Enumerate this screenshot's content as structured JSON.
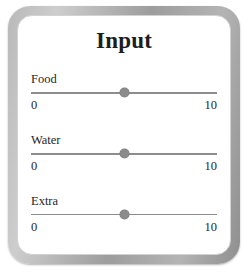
{
  "panel": {
    "title": "Input",
    "frame_color": "#a8a8a8",
    "background_color": "#ffffff"
  },
  "sliders": [
    {
      "label": "Food",
      "min_label": "0",
      "max_label": "10",
      "min": 0,
      "max": 10,
      "value": 5,
      "handle_percent": 50,
      "track_color": "#8d8d8d",
      "handle_color": "#8b8b8b"
    },
    {
      "label": "Water",
      "min_label": "0",
      "max_label": "10",
      "min": 0,
      "max": 10,
      "value": 5,
      "handle_percent": 50,
      "track_color": "#8d8d8d",
      "handle_color": "#8b8b8b"
    },
    {
      "label": "Extra",
      "min_label": "0",
      "max_label": "10",
      "min": 0,
      "max": 10,
      "value": 5,
      "handle_percent": 50,
      "track_color": "#8d8d8d",
      "handle_color": "#8b8b8b"
    }
  ]
}
